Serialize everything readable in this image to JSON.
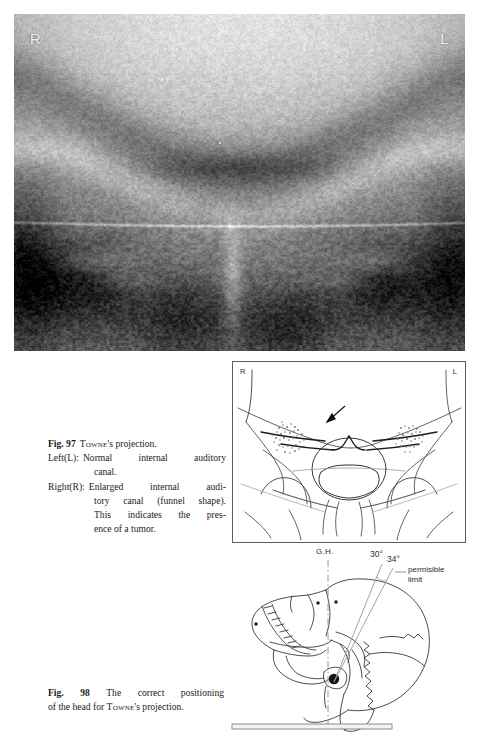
{
  "page": {
    "background_color": "#ffffff",
    "text_color": "#1b1b1b"
  },
  "xray_figure": {
    "name": "towne-projection-radiograph",
    "markers": {
      "right": "R",
      "left": "L"
    }
  },
  "caption_97": {
    "fig_number": "Fig. 97",
    "title_name": "Towne",
    "title_rest": "'s projection.",
    "rows": [
      {
        "key": "Left(L):",
        "value": "Normal  internal  auditory"
      },
      {
        "key": "",
        "value": "canal."
      },
      {
        "key": "Right(R):",
        "value": "Enlarged  internal  audi-"
      },
      {
        "key": "",
        "value": "tory canal (funnel shape)."
      },
      {
        "key": "",
        "value": "This  indicates  the  pres-"
      },
      {
        "key": "",
        "value": "ence of a tumor."
      }
    ]
  },
  "schematic_figure": {
    "name": "towne-projection-line-diagram",
    "markers": {
      "right": "R",
      "left": "L"
    },
    "annotation": "arrow-pointing-to-enlarged-canal"
  },
  "skull_figure": {
    "name": "head-positioning-diagram",
    "labels": {
      "german_horizontal": "G.H.",
      "angle_min": "30°",
      "angle_max": "34°",
      "permissible_limit_line1": "permisible",
      "permissible_limit_line2": "limit"
    }
  },
  "caption_98": {
    "fig_number": "Fig. 98",
    "line1": "The   correct   positioning",
    "line2_pre": "of the head for ",
    "line2_name": "Towne",
    "line2_post": "'s projection."
  }
}
